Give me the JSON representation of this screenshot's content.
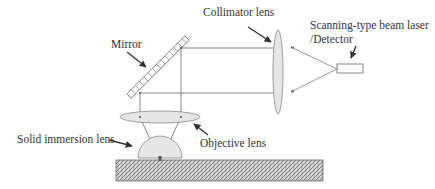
{
  "diagram": {
    "labels": {
      "collimator": "Collimator lens",
      "laser_line1": "Scanning-type beam laser",
      "laser_line2": "/Detector",
      "mirror": "Mirror",
      "sil": "Solid immersion lens",
      "objective": "Objective lens"
    },
    "components": [
      "Mirror",
      "Collimator lens",
      "Scanning-type beam laser/Detector",
      "Objective lens",
      "Solid immersion lens",
      "Sample"
    ],
    "colors": {
      "line": "#555555",
      "lens_fill": "#e6e6e6",
      "arrow": "#333333",
      "hatch": "#666666"
    }
  }
}
